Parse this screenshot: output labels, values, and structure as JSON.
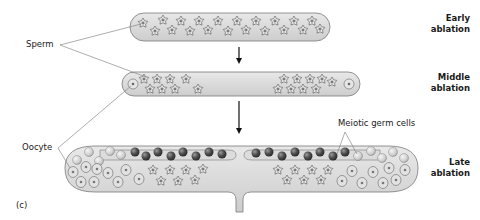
{
  "panel_label": "(c)",
  "stages": [
    {
      "line1": "Early",
      "line2": "ablation"
    },
    {
      "line1": "Middle",
      "line2": "ablation"
    },
    {
      "line1": "Late",
      "line2": "ablation"
    }
  ],
  "labels": {
    "sperm": "Sperm",
    "oocyte": "Oocyte",
    "meiotic": "Meiotic germ cells"
  },
  "colors": {
    "tube_fill": "#d9d9d9",
    "tube_stroke": "#7a7a7a",
    "dark_cell": "#4a4a4a",
    "light_cell": "#d0d0d0",
    "arrow": "#111111"
  }
}
